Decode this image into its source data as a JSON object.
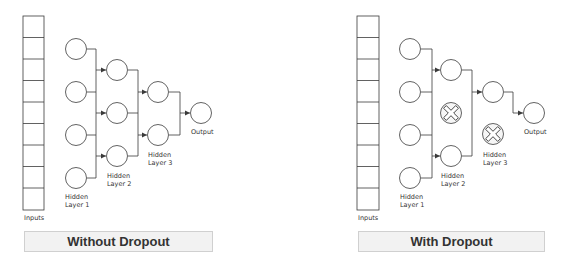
{
  "diagrams": [
    {
      "title": "Without Dropout",
      "labels": {
        "inputs": "Inputs",
        "hidden1_a": "Hidden",
        "hidden1_b": "Layer 1",
        "hidden2_a": "Hidden",
        "hidden2_b": "Layer 2",
        "hidden3_a": "Hidden",
        "hidden3_b": "Layer 3",
        "output": "Output"
      },
      "input_cells": 9,
      "layers": [
        {
          "name": "Hidden Layer 1",
          "nodes": 4,
          "dropped": []
        },
        {
          "name": "Hidden Layer 2",
          "nodes": 3,
          "dropped": []
        },
        {
          "name": "Hidden Layer 3",
          "nodes": 2,
          "dropped": []
        },
        {
          "name": "Output",
          "nodes": 1,
          "dropped": []
        }
      ]
    },
    {
      "title": "With Dropout",
      "labels": {
        "inputs": "Inputs",
        "hidden1_a": "Hidden",
        "hidden1_b": "Layer 1",
        "hidden2_a": "Hidden",
        "hidden2_b": "Layer 2",
        "hidden3_a": "Hidden",
        "hidden3_b": "Layer 3",
        "output": "Output"
      },
      "input_cells": 9,
      "layers": [
        {
          "name": "Hidden Layer 1",
          "nodes": 4,
          "dropped": []
        },
        {
          "name": "Hidden Layer 2",
          "nodes": 3,
          "dropped": [
            2
          ]
        },
        {
          "name": "Hidden Layer 3",
          "nodes": 2,
          "dropped": [
            2
          ]
        },
        {
          "name": "Output",
          "nodes": 1,
          "dropped": []
        }
      ]
    }
  ],
  "colors": {
    "stroke": "#3a3a3a",
    "banner_fill": "#f2f2f2",
    "banner_border": "#d0d0d0",
    "text": "#333333"
  }
}
